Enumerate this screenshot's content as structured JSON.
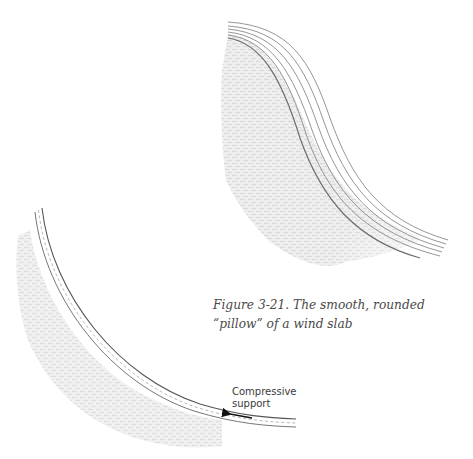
{
  "figure": {
    "caption": "Figure 3-21. The smooth, rounded “pillow” of a wind slab",
    "top_illustration": {
      "name": "wind-slab-pillow",
      "layer_lines": 6,
      "colors": {
        "line": "#7a7a7a",
        "fill": "#e2e2e2"
      }
    },
    "bottom_illustration": {
      "name": "slab-compressive-support",
      "label_line1": "Compressive",
      "label_line2": "support",
      "colors": {
        "line": "#6a6a6a",
        "fill": "#e4e4e4",
        "arrow": "#111111"
      }
    }
  }
}
